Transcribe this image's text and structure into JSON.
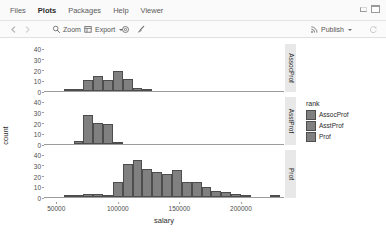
{
  "window": {
    "tabs": [
      {
        "label": "Files",
        "active": false
      },
      {
        "label": "Plots",
        "active": true
      },
      {
        "label": "Packages",
        "active": false
      },
      {
        "label": "Help",
        "active": false
      },
      {
        "label": "Viewer",
        "active": false
      }
    ],
    "minimize_icon": "minimize-icon",
    "maximize_icon": "maximize-icon"
  },
  "toolbar": {
    "back_icon": "back-arrow-icon",
    "forward_icon": "forward-arrow-icon",
    "zoom_label": "Zoom",
    "zoom_icon": "magnifier-icon",
    "export_label": "Export",
    "export_icon": "export-icon",
    "export_caret": "chevron-down-icon",
    "gear_icon": "gear-icon",
    "broom_icon": "broom-icon",
    "publish_label": "Publish",
    "publish_icon": "publish-icon",
    "publish_caret": "chevron-down-icon",
    "refresh_icon": "refresh-icon"
  },
  "chart_data": {
    "type": "bar",
    "title": "",
    "subtitle": "",
    "xlabel": "salary",
    "ylabel": "count",
    "grid": false,
    "legend_position": "right",
    "legend_title": "rank",
    "legend_entries": [
      "AssocProf",
      "AsstProf",
      "Prof"
    ],
    "fill_color": "#808080",
    "border_color": "#4d4d4d",
    "strip_bg": "#e8e8e8",
    "xlim": [
      40000,
      235000
    ],
    "ylim": [
      0,
      44
    ],
    "xticks": [
      50000,
      100000,
      150000,
      200000
    ],
    "xtick_labels": [
      "50000",
      "100000",
      "150000",
      "200000"
    ],
    "yticks": [
      0,
      10,
      20,
      30,
      40
    ],
    "ytick_labels": [
      "0",
      "10",
      "20",
      "30",
      "40"
    ],
    "binwidth": 8000,
    "facets": [
      {
        "name": "AssocProf",
        "bins": [
          {
            "x0": 56000,
            "x1": 64000,
            "count": 1
          },
          {
            "x0": 64000,
            "x1": 72000,
            "count": 1
          },
          {
            "x0": 72000,
            "x1": 80000,
            "count": 10
          },
          {
            "x0": 80000,
            "x1": 88000,
            "count": 14
          },
          {
            "x0": 88000,
            "x1": 96000,
            "count": 10
          },
          {
            "x0": 96000,
            "x1": 104000,
            "count": 19
          },
          {
            "x0": 104000,
            "x1": 112000,
            "count": 11
          },
          {
            "x0": 112000,
            "x1": 120000,
            "count": 3
          },
          {
            "x0": 120000,
            "x1": 128000,
            "count": 2
          }
        ]
      },
      {
        "name": "AsstProf",
        "bins": [
          {
            "x0": 64000,
            "x1": 72000,
            "count": 3
          },
          {
            "x0": 72000,
            "x1": 80000,
            "count": 27
          },
          {
            "x0": 80000,
            "x1": 88000,
            "count": 20
          },
          {
            "x0": 88000,
            "x1": 96000,
            "count": 19
          },
          {
            "x0": 96000,
            "x1": 104000,
            "count": 1
          }
        ]
      },
      {
        "name": "Prof",
        "bins": [
          {
            "x0": 56000,
            "x1": 64000,
            "count": 1
          },
          {
            "x0": 64000,
            "x1": 72000,
            "count": 1
          },
          {
            "x0": 72000,
            "x1": 80000,
            "count": 3
          },
          {
            "x0": 80000,
            "x1": 88000,
            "count": 3
          },
          {
            "x0": 88000,
            "x1": 96000,
            "count": 2
          },
          {
            "x0": 96000,
            "x1": 104000,
            "count": 14
          },
          {
            "x0": 104000,
            "x1": 112000,
            "count": 31
          },
          {
            "x0": 112000,
            "x1": 120000,
            "count": 35
          },
          {
            "x0": 120000,
            "x1": 128000,
            "count": 26
          },
          {
            "x0": 128000,
            "x1": 136000,
            "count": 23
          },
          {
            "x0": 136000,
            "x1": 144000,
            "count": 22
          },
          {
            "x0": 144000,
            "x1": 152000,
            "count": 25
          },
          {
            "x0": 152000,
            "x1": 160000,
            "count": 14
          },
          {
            "x0": 160000,
            "x1": 168000,
            "count": 14
          },
          {
            "x0": 168000,
            "x1": 176000,
            "count": 9
          },
          {
            "x0": 176000,
            "x1": 184000,
            "count": 6
          },
          {
            "x0": 184000,
            "x1": 192000,
            "count": 5
          },
          {
            "x0": 192000,
            "x1": 200000,
            "count": 3
          },
          {
            "x0": 200000,
            "x1": 208000,
            "count": 1
          },
          {
            "x0": 224000,
            "x1": 232000,
            "count": 1
          }
        ]
      }
    ]
  }
}
